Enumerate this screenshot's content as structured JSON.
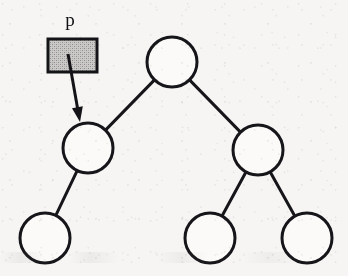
{
  "figure": {
    "kind": "binary-tree-pointer-diagram",
    "width": 348,
    "height": 276,
    "background_color": "#f6f5f3",
    "ink_color": "#16161a"
  },
  "pointer": {
    "label": "p",
    "label_x": 70,
    "label_y": 26,
    "box": {
      "x": 48,
      "y": 39,
      "width": 49,
      "height": 33,
      "fill_color": "#b9b8b6",
      "border_color": "#141418",
      "border_width": 3,
      "fill_style": "dithered-gray-halftone"
    },
    "arrow": {
      "from_x": 68,
      "from_y": 54,
      "to_x": 80,
      "to_y": 122,
      "stroke_width": 3,
      "head_length": 15,
      "head_width": 11,
      "points_to_node": "left-child"
    }
  },
  "tree": {
    "node_radius": 25,
    "node_stroke_width": 3,
    "node_fill_color": "#fbfaf8",
    "edge_stroke_width": 3,
    "nodes": [
      {
        "id": "root",
        "name": "root-node",
        "cx": 172,
        "cy": 62,
        "r": 25,
        "level": 0,
        "label": ""
      },
      {
        "id": "left-child",
        "name": "left-child-node",
        "cx": 88,
        "cy": 148,
        "r": 25,
        "level": 1,
        "label": ""
      },
      {
        "id": "right-child",
        "name": "right-child-node",
        "cx": 258,
        "cy": 150,
        "r": 25,
        "level": 1,
        "label": ""
      },
      {
        "id": "leaf-left",
        "name": "leaf-left-node",
        "cx": 45,
        "cy": 238,
        "r": 25,
        "level": 2,
        "label": ""
      },
      {
        "id": "leaf-middle",
        "name": "leaf-middle-node",
        "cx": 210,
        "cy": 238,
        "r": 25,
        "level": 2,
        "label": ""
      },
      {
        "id": "leaf-right",
        "name": "leaf-right-node",
        "cx": 307,
        "cy": 238,
        "r": 25,
        "level": 2,
        "label": ""
      }
    ],
    "edges": [
      {
        "id": "root-left",
        "from": "root",
        "to": "left-child"
      },
      {
        "id": "root-right",
        "from": "root",
        "to": "right-child"
      },
      {
        "id": "left-leafleft",
        "from": "left-child",
        "to": "leaf-left"
      },
      {
        "id": "right-leafmiddle",
        "from": "right-child",
        "to": "leaf-middle"
      },
      {
        "id": "right-leafright",
        "from": "right-child",
        "to": "leaf-right"
      }
    ]
  }
}
